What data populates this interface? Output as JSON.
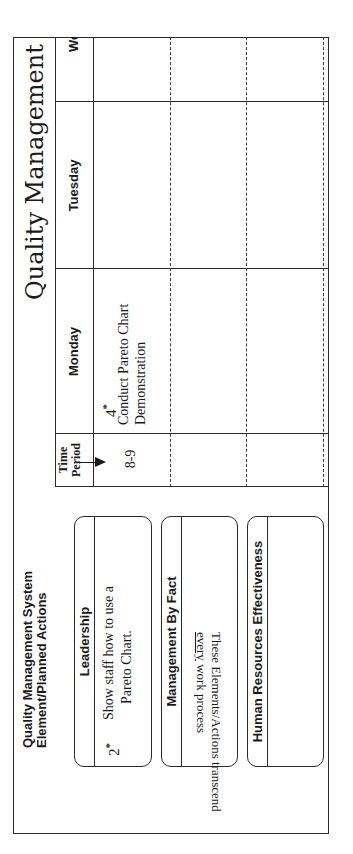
{
  "document": {
    "title": "Quality Management System",
    "title_visible": "Quality Management Sy",
    "orientation": "rotated 90° counter-clockwise"
  },
  "schedule": {
    "time_header": {
      "line1": "Time",
      "line2": "Period"
    },
    "days": [
      {
        "label": "Monday"
      },
      {
        "label": "Tuesday"
      },
      {
        "label": "We"
      }
    ],
    "rows": [
      {
        "time": "8-9",
        "monday": {
          "number": "4",
          "marker": "*",
          "text_line1": "Conduct Pareto Chart",
          "text_line2": "Demonstration"
        },
        "tuesday": "",
        "wednesday": ""
      },
      {
        "time": "",
        "monday": "",
        "tuesday": "",
        "wednesday": ""
      },
      {
        "time": "",
        "monday": "",
        "tuesday": "",
        "wednesday": ""
      },
      {
        "time": "",
        "monday": "",
        "tuesday": "",
        "wednesday": ""
      }
    ]
  },
  "elements_panel": {
    "heading_line1": "Quality Management System",
    "heading_line2": "Element/Planned Actions",
    "elements": [
      {
        "title": "Leadership",
        "number": "2",
        "marker": "*",
        "action_line1": "Show staff how to use a",
        "action_line2": "Pareto Chart."
      },
      {
        "title": "Management By Fact",
        "number": "",
        "action_line1": "",
        "action_line2": ""
      },
      {
        "title": "Human Resources Effectiveness",
        "number": "",
        "action_line1": "",
        "action_line2": ""
      }
    ]
  },
  "footer_note": {
    "line1": "These Elements/Actions transcend",
    "line2_underlined": "every",
    "line2_rest": " work process"
  }
}
